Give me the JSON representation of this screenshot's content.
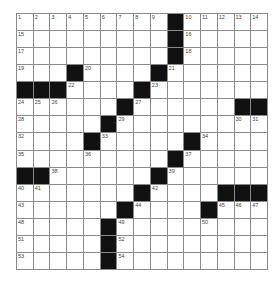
{
  "puzzle": {
    "rows": 15,
    "cols": 15,
    "grid": [
      [
        "1",
        "2",
        "3",
        "4",
        "5",
        "6",
        "7",
        "8",
        "9",
        "#",
        "10",
        "11",
        "12",
        "13",
        "14"
      ],
      [
        "15",
        ".",
        ".",
        ".",
        ".",
        ".",
        ".",
        ".",
        ".",
        "#",
        "16",
        ".",
        ".",
        ".",
        "."
      ],
      [
        "17",
        ".",
        ".",
        ".",
        ".",
        ".",
        ".",
        ".",
        ".",
        "#",
        "18",
        ".",
        ".",
        ".",
        "."
      ],
      [
        "19",
        ".",
        ".",
        "#",
        "20",
        ".",
        ".",
        ".",
        "#",
        "21",
        ".",
        ".",
        ".",
        ".",
        "."
      ],
      [
        "#",
        "#",
        "#",
        "22",
        ".",
        ".",
        ".",
        "#",
        "23",
        ".",
        ".",
        ".",
        ".",
        ".",
        "."
      ],
      [
        "24",
        "25",
        "26",
        ".",
        ".",
        ".",
        "#",
        "27",
        ".",
        ".",
        ".",
        ".",
        ".",
        "#",
        "#"
      ],
      [
        "28",
        ".",
        ".",
        ".",
        ".",
        "#",
        "29",
        ".",
        ".",
        ".",
        ".",
        ".",
        ".",
        "30",
        "31"
      ],
      [
        "32",
        ".",
        ".",
        ".",
        "#",
        "33",
        ".",
        ".",
        ".",
        ".",
        "#",
        "34",
        ".",
        ".",
        "."
      ],
      [
        "35",
        ".",
        ".",
        ".",
        "36",
        ".",
        ".",
        ".",
        ".",
        "#",
        "37",
        ".",
        ".",
        ".",
        "."
      ],
      [
        "#",
        "#",
        "38",
        ".",
        ".",
        ".",
        ".",
        ".",
        "#",
        "39",
        ".",
        ".",
        ".",
        ".",
        "."
      ],
      [
        "40",
        "41",
        ".",
        ".",
        ".",
        ".",
        ".",
        "#",
        "42",
        ".",
        ".",
        ".",
        "#",
        "#",
        "#"
      ],
      [
        "43",
        ".",
        ".",
        ".",
        ".",
        ".",
        "#",
        "44",
        ".",
        ".",
        ".",
        "#",
        "45",
        "46",
        "47"
      ],
      [
        "48",
        ".",
        ".",
        ".",
        ".",
        "#",
        "49",
        ".",
        ".",
        ".",
        ".",
        "50",
        ".",
        ".",
        "."
      ],
      [
        "51",
        ".",
        ".",
        ".",
        ".",
        "#",
        "52",
        ".",
        ".",
        ".",
        ".",
        ".",
        ".",
        ".",
        "."
      ],
      [
        "53",
        ".",
        ".",
        ".",
        ".",
        "#",
        "54",
        ".",
        ".",
        ".",
        ".",
        ".",
        ".",
        ".",
        "."
      ]
    ],
    "colors": {
      "block": "#111111",
      "cell": "#ffffff",
      "gridline": "#8a8a8a",
      "number": "#444444"
    }
  }
}
